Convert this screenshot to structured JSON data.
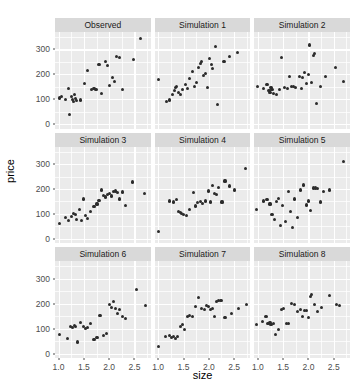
{
  "chart_data": {
    "type": "scatter",
    "title": "",
    "xlabel": "size",
    "ylabel": "price",
    "xlim": [
      0.93,
      2.82
    ],
    "ylim": [
      -18,
      370
    ],
    "grid": true,
    "legend": "none",
    "facet_layout": {
      "rows": 3,
      "cols": 3
    },
    "x_ticks": [
      1.0,
      1.5,
      2.0,
      2.5
    ],
    "x_tick_labels": [
      "1.0",
      "1.5",
      "2.0",
      "2.5"
    ],
    "y_ticks": [
      0,
      100,
      200,
      300
    ],
    "y_tick_labels": [
      "0",
      "100",
      "200",
      "300"
    ],
    "x_minor_ticks": [
      1.25,
      1.75,
      2.25,
      2.75
    ],
    "y_minor_ticks": [
      50,
      150,
      250,
      350
    ],
    "point_color": "#2b2b2b",
    "panel_background": "#ebebeb",
    "strip_background": "#d9d9d9",
    "gridline_color": "#ffffff",
    "panels": [
      {
        "label": "Observed",
        "points": [
          [
            1.01,
            105
          ],
          [
            1.05,
            112
          ],
          [
            1.13,
            98
          ],
          [
            1.2,
            145
          ],
          [
            1.22,
            40
          ],
          [
            1.26,
            112
          ],
          [
            1.28,
            100
          ],
          [
            1.3,
            92
          ],
          [
            1.32,
            118
          ],
          [
            1.34,
            104
          ],
          [
            1.36,
            96
          ],
          [
            1.44,
            97
          ],
          [
            1.52,
            165
          ],
          [
            1.58,
            215
          ],
          [
            1.66,
            140
          ],
          [
            1.7,
            142
          ],
          [
            1.74,
            141
          ],
          [
            1.8,
            240
          ],
          [
            1.84,
            122
          ],
          [
            1.92,
            253
          ],
          [
            1.96,
            236
          ],
          [
            2.0,
            155
          ],
          [
            2.06,
            186
          ],
          [
            2.1,
            172
          ],
          [
            2.14,
            272
          ],
          [
            2.2,
            268
          ],
          [
            2.26,
            141
          ],
          [
            2.48,
            260
          ],
          [
            2.62,
            345
          ]
        ]
      },
      {
        "label": "Simulation 1",
        "points": [
          [
            1.0,
            180
          ],
          [
            1.16,
            92
          ],
          [
            1.22,
            97
          ],
          [
            1.28,
            120
          ],
          [
            1.32,
            135
          ],
          [
            1.34,
            146
          ],
          [
            1.36,
            152
          ],
          [
            1.4,
            128
          ],
          [
            1.44,
            118
          ],
          [
            1.48,
            138
          ],
          [
            1.54,
            160
          ],
          [
            1.58,
            143
          ],
          [
            1.62,
            184
          ],
          [
            1.68,
            210
          ],
          [
            1.72,
            150
          ],
          [
            1.76,
            168
          ],
          [
            1.8,
            228
          ],
          [
            1.84,
            244
          ],
          [
            1.86,
            252
          ],
          [
            1.9,
            196
          ],
          [
            1.94,
            205
          ],
          [
            1.98,
            146
          ],
          [
            2.02,
            265
          ],
          [
            2.06,
            240
          ],
          [
            2.08,
            223
          ],
          [
            2.14,
            310
          ],
          [
            2.18,
            80
          ],
          [
            2.3,
            252
          ],
          [
            2.4,
            270
          ],
          [
            2.56,
            288
          ]
        ]
      },
      {
        "label": "Simulation 2",
        "points": [
          [
            1.0,
            152
          ],
          [
            1.12,
            142
          ],
          [
            1.18,
            158
          ],
          [
            1.22,
            135
          ],
          [
            1.24,
            128
          ],
          [
            1.26,
            148
          ],
          [
            1.28,
            140
          ],
          [
            1.3,
            122
          ],
          [
            1.36,
            118
          ],
          [
            1.42,
            138
          ],
          [
            1.46,
            268
          ],
          [
            1.52,
            146
          ],
          [
            1.58,
            143
          ],
          [
            1.62,
            190
          ],
          [
            1.66,
            150
          ],
          [
            1.7,
            152
          ],
          [
            1.74,
            148
          ],
          [
            1.82,
            192
          ],
          [
            1.86,
            145
          ],
          [
            1.88,
            188
          ],
          [
            1.92,
            208
          ],
          [
            1.96,
            165
          ],
          [
            2.0,
            200
          ],
          [
            2.02,
            318
          ],
          [
            2.06,
            168
          ],
          [
            2.1,
            276
          ],
          [
            2.12,
            284
          ],
          [
            2.16,
            82
          ],
          [
            2.24,
            152
          ],
          [
            2.34,
            190
          ],
          [
            2.54,
            228
          ],
          [
            2.7,
            172
          ]
        ]
      },
      {
        "label": "Simulation 3",
        "points": [
          [
            1.02,
            62
          ],
          [
            1.14,
            85
          ],
          [
            1.2,
            72
          ],
          [
            1.26,
            88
          ],
          [
            1.3,
            100
          ],
          [
            1.34,
            96
          ],
          [
            1.36,
            78
          ],
          [
            1.42,
            118
          ],
          [
            1.46,
            75
          ],
          [
            1.5,
            160
          ],
          [
            1.54,
            92
          ],
          [
            1.58,
            80
          ],
          [
            1.64,
            110
          ],
          [
            1.7,
            128
          ],
          [
            1.76,
            140
          ],
          [
            1.8,
            155
          ],
          [
            1.84,
            196
          ],
          [
            1.88,
            175
          ],
          [
            1.92,
            168
          ],
          [
            1.96,
            178
          ],
          [
            2.0,
            182
          ],
          [
            2.04,
            172
          ],
          [
            2.08,
            190
          ],
          [
            2.12,
            192
          ],
          [
            2.16,
            186
          ],
          [
            2.2,
            160
          ],
          [
            2.26,
            188
          ],
          [
            2.32,
            135
          ],
          [
            2.46,
            228
          ],
          [
            2.7,
            182
          ]
        ]
      },
      {
        "label": "Simulation 4",
        "points": [
          [
            1.0,
            30
          ],
          [
            1.22,
            152
          ],
          [
            1.3,
            148
          ],
          [
            1.36,
            158
          ],
          [
            1.4,
            110
          ],
          [
            1.44,
            104
          ],
          [
            1.46,
            100
          ],
          [
            1.5,
            96
          ],
          [
            1.56,
            92
          ],
          [
            1.62,
            118
          ],
          [
            1.7,
            185
          ],
          [
            1.74,
            132
          ],
          [
            1.78,
            146
          ],
          [
            1.84,
            150
          ],
          [
            1.88,
            142
          ],
          [
            1.94,
            152
          ],
          [
            2.0,
            192
          ],
          [
            2.04,
            148
          ],
          [
            2.08,
            215
          ],
          [
            2.12,
            182
          ],
          [
            2.16,
            178
          ],
          [
            2.2,
            205
          ],
          [
            2.26,
            148
          ],
          [
            2.32,
            232
          ],
          [
            2.4,
            212
          ],
          [
            2.5,
            196
          ],
          [
            2.72,
            282
          ]
        ]
      },
      {
        "label": "Simulation 5",
        "points": [
          [
            0.98,
            118
          ],
          [
            1.12,
            152
          ],
          [
            1.18,
            158
          ],
          [
            1.24,
            140
          ],
          [
            1.28,
            96
          ],
          [
            1.32,
            78
          ],
          [
            1.36,
            150
          ],
          [
            1.4,
            162
          ],
          [
            1.44,
            52
          ],
          [
            1.48,
            134
          ],
          [
            1.54,
            68
          ],
          [
            1.6,
            190
          ],
          [
            1.64,
            108
          ],
          [
            1.68,
            46
          ],
          [
            1.72,
            160
          ],
          [
            1.78,
            86
          ],
          [
            1.84,
            196
          ],
          [
            1.9,
            216
          ],
          [
            1.96,
            136
          ],
          [
            2.0,
            152
          ],
          [
            2.04,
            112
          ],
          [
            2.1,
            204
          ],
          [
            2.14,
            204
          ],
          [
            2.18,
            202
          ],
          [
            2.24,
            148
          ],
          [
            2.3,
            190
          ],
          [
            2.42,
            196
          ],
          [
            2.7,
            312
          ]
        ]
      },
      {
        "label": "Simulation 6",
        "points": [
          [
            1.02,
            78
          ],
          [
            1.18,
            62
          ],
          [
            1.24,
            108
          ],
          [
            1.28,
            104
          ],
          [
            1.32,
            112
          ],
          [
            1.34,
            110
          ],
          [
            1.38,
            46
          ],
          [
            1.44,
            124
          ],
          [
            1.5,
            110
          ],
          [
            1.54,
            102
          ],
          [
            1.58,
            106
          ],
          [
            1.64,
            122
          ],
          [
            1.7,
            58
          ],
          [
            1.76,
            64
          ],
          [
            1.82,
            152
          ],
          [
            1.88,
            72
          ],
          [
            1.94,
            80
          ],
          [
            2.0,
            196
          ],
          [
            2.04,
            186
          ],
          [
            2.08,
            208
          ],
          [
            2.12,
            182
          ],
          [
            2.16,
            160
          ],
          [
            2.2,
            178
          ],
          [
            2.26,
            148
          ],
          [
            2.32,
            140
          ],
          [
            2.54,
            256
          ],
          [
            2.72,
            192
          ]
        ]
      },
      {
        "label": "Simulation 7",
        "points": [
          [
            1.0,
            28
          ],
          [
            1.14,
            68
          ],
          [
            1.22,
            72
          ],
          [
            1.26,
            66
          ],
          [
            1.3,
            70
          ],
          [
            1.34,
            62
          ],
          [
            1.38,
            68
          ],
          [
            1.44,
            108
          ],
          [
            1.48,
            118
          ],
          [
            1.52,
            95
          ],
          [
            1.58,
            148
          ],
          [
            1.62,
            152
          ],
          [
            1.68,
            150
          ],
          [
            1.74,
            188
          ],
          [
            1.8,
            225
          ],
          [
            1.86,
            182
          ],
          [
            1.92,
            178
          ],
          [
            1.96,
            192
          ],
          [
            2.0,
            190
          ],
          [
            2.04,
            176
          ],
          [
            2.08,
            182
          ],
          [
            2.12,
            148
          ],
          [
            2.16,
            208
          ],
          [
            2.2,
            212
          ],
          [
            2.24,
            212
          ],
          [
            2.32,
            146
          ],
          [
            2.44,
            160
          ],
          [
            2.58,
            182
          ],
          [
            2.74,
            196
          ]
        ]
      },
      {
        "label": "Simulation 8",
        "points": [
          [
            0.98,
            115
          ],
          [
            1.1,
            128
          ],
          [
            1.16,
            148
          ],
          [
            1.2,
            122
          ],
          [
            1.24,
            126
          ],
          [
            1.26,
            118
          ],
          [
            1.3,
            120
          ],
          [
            1.34,
            78
          ],
          [
            1.4,
            96
          ],
          [
            1.46,
            178
          ],
          [
            1.5,
            180
          ],
          [
            1.56,
            120
          ],
          [
            1.6,
            122
          ],
          [
            1.66,
            200
          ],
          [
            1.72,
            196
          ],
          [
            1.78,
            168
          ],
          [
            1.84,
            176
          ],
          [
            1.88,
            150
          ],
          [
            1.92,
            172
          ],
          [
            1.96,
            174
          ],
          [
            2.0,
            144
          ],
          [
            2.04,
            230
          ],
          [
            2.06,
            236
          ],
          [
            2.12,
            196
          ],
          [
            2.18,
            168
          ],
          [
            2.26,
            184
          ],
          [
            2.42,
            232
          ],
          [
            2.56,
            196
          ],
          [
            2.62,
            192
          ]
        ]
      }
    ]
  }
}
